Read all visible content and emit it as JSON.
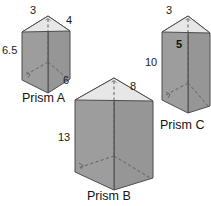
{
  "figure": {
    "kind": "geometry-diagram",
    "background_color": "#ffffff",
    "colors": {
      "front_face": "#9b9b9b",
      "right_face": "#9b9b9b",
      "top_face": "#e6e6e6",
      "outline": "#4d4d4d",
      "hidden_edge": "#6e6e6e",
      "text": "#1a1a1a"
    }
  },
  "prisms": [
    {
      "id": "prism-a",
      "name": "Prism A",
      "name_pos": {
        "x": 22,
        "y": 102
      },
      "labels": [
        {
          "key": "top_left_edge",
          "value": "3",
          "x": 30,
          "y": 14,
          "bold": false
        },
        {
          "key": "top_right_edge",
          "value": "4",
          "x": 66,
          "y": 24,
          "bold": false
        },
        {
          "key": "height",
          "value": "6.5",
          "x": 2,
          "y": 54,
          "bold": false
        }
      ],
      "geometry": {
        "apex": {
          "x": 48,
          "y": 16
        },
        "top_left": {
          "x": 22,
          "y": 32
        },
        "top_right": {
          "x": 70,
          "y": 31
        },
        "bottom_left": {
          "x": 22,
          "y": 80
        },
        "bottom_right": {
          "x": 70,
          "y": 79
        },
        "front_bottom": {
          "x": 48,
          "y": 93
        },
        "mid": {
          "x": 48,
          "y": 62
        }
      }
    },
    {
      "id": "prism-b",
      "name": "Prism B",
      "name_pos": {
        "x": 87,
        "y": 200
      },
      "labels": [
        {
          "key": "top_left_edge",
          "value": "6",
          "x": 63,
          "y": 84,
          "bold": false
        },
        {
          "key": "top_right_edge",
          "value": "8",
          "x": 130,
          "y": 90,
          "bold": false
        },
        {
          "key": "height",
          "value": "13",
          "x": 58,
          "y": 141,
          "bold": false
        }
      ],
      "geometry": {
        "apex": {
          "x": 114,
          "y": 78
        },
        "top_left": {
          "x": 75,
          "y": 100
        },
        "top_right": {
          "x": 153,
          "y": 101
        },
        "bottom_left": {
          "x": 75,
          "y": 172
        },
        "bottom_right": {
          "x": 153,
          "y": 178
        },
        "front_bottom": {
          "x": 114,
          "y": 190
        },
        "mid": {
          "x": 114,
          "y": 156
        }
      }
    },
    {
      "id": "prism-c",
      "name": "Prism C",
      "name_pos": {
        "x": 160,
        "y": 129
      },
      "labels": [
        {
          "key": "top_left_edge",
          "value": "3",
          "x": 166,
          "y": 14,
          "bold": false
        },
        {
          "key": "depth",
          "value": "5",
          "x": 176,
          "y": 48,
          "bold": true
        },
        {
          "key": "height",
          "value": "10",
          "x": 145,
          "y": 66,
          "bold": false
        }
      ],
      "geometry": {
        "apex": {
          "x": 188,
          "y": 16
        },
        "top_left": {
          "x": 162,
          "y": 32
        },
        "top_right": {
          "x": 210,
          "y": 33
        },
        "bottom_left": {
          "x": 162,
          "y": 100
        },
        "bottom_right": {
          "x": 210,
          "y": 106
        },
        "front_bottom": {
          "x": 188,
          "y": 113
        },
        "mid": {
          "x": 188,
          "y": 83
        }
      }
    }
  ]
}
